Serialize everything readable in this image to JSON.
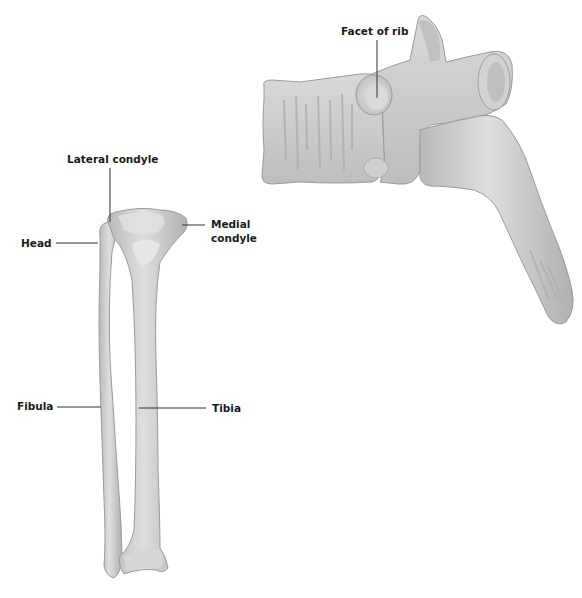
{
  "diagram": {
    "type": "anatomical-illustration",
    "figures": [
      {
        "name": "tibia-and-fibula",
        "labels": {
          "lateral_condyle": "Lateral condyle",
          "medial_condyle_line1": "Medial",
          "medial_condyle_line2": "condyle",
          "head": "Head",
          "fibula": "Fibula",
          "tibia": "Tibia"
        }
      },
      {
        "name": "thoracic-vertebra-lateral",
        "labels": {
          "facet_of_rib": "Facet of rib"
        }
      }
    ],
    "colors": {
      "bone_fill": "#c9c9c9",
      "bone_light": "#e2e2e2",
      "bone_shadow": "#a8a8a8",
      "leader_line": "#333333",
      "background": "#ffffff"
    }
  }
}
